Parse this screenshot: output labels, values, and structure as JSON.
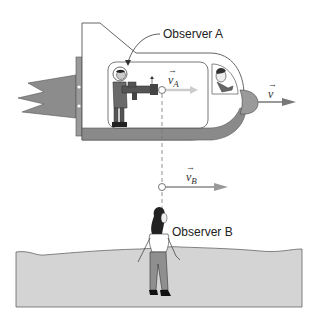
{
  "figure": {
    "labels": {
      "observer_a": "Observer A",
      "observer_b": "Observer B"
    },
    "vectors": {
      "v": {
        "symbol": "v",
        "subscript": "",
        "arrow": "→"
      },
      "v_a": {
        "symbol": "v",
        "subscript": "A",
        "arrow": "→"
      },
      "v_b": {
        "symbol": "v",
        "subscript": "B",
        "arrow": "→"
      }
    },
    "colors": {
      "ship_body": "#ffffff",
      "ship_outline": "#555555",
      "ship_floor": "#8a8a8a",
      "flame": "#8c8c8c",
      "ground": "#d4d4d4",
      "arrow": "#888888",
      "arrow_light": "#cccccc"
    }
  }
}
